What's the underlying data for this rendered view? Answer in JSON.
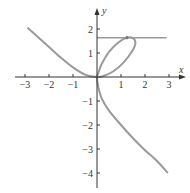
{
  "chart_data": {
    "type": "line",
    "title": "",
    "xlabel": "x",
    "ylabel": "y",
    "xlim": [
      -3.3,
      3.4
    ],
    "ylim": [
      -4.6,
      2.7
    ],
    "xticks": [
      -3,
      -2,
      -1,
      1,
      2,
      3
    ],
    "yticks": [
      2,
      1,
      -1,
      -2,
      -3,
      -4
    ],
    "xtick_labels": [
      "−3",
      "−2",
      "−1",
      "1",
      "2",
      "3"
    ],
    "ytick_labels": [
      "2",
      "1",
      "−1",
      "−2",
      "−3",
      "−4"
    ],
    "grid": false,
    "legend": null,
    "series": [
      {
        "name": "parametric curve",
        "color": "#9a9a9a",
        "points": [
          [
            -2.9,
            2.05
          ],
          [
            -2.5,
            1.7
          ],
          [
            -2.0,
            1.25
          ],
          [
            -1.5,
            0.8
          ],
          [
            -1.0,
            0.4
          ],
          [
            -0.5,
            0.1
          ],
          [
            0.0,
            0.0
          ],
          [
            0.3,
            0.05
          ],
          [
            0.7,
            0.25
          ],
          [
            1.1,
            0.6
          ],
          [
            1.45,
            1.05
          ],
          [
            1.6,
            1.4
          ],
          [
            1.5,
            1.62
          ],
          [
            1.25,
            1.64
          ],
          [
            0.9,
            1.45
          ],
          [
            0.5,
            1.05
          ],
          [
            0.2,
            0.55
          ],
          [
            0.05,
            0.15
          ],
          [
            0.0,
            0.0
          ],
          [
            0.05,
            -0.4
          ],
          [
            0.2,
            -0.9
          ],
          [
            0.5,
            -1.4
          ],
          [
            1.0,
            -2.0
          ],
          [
            1.5,
            -2.55
          ],
          [
            2.0,
            -3.05
          ],
          [
            2.5,
            -3.5
          ],
          [
            2.95,
            -4.0
          ]
        ]
      },
      {
        "name": "horizontal tangent line",
        "color": "#9a9a9a",
        "points": [
          [
            0.0,
            1.64
          ],
          [
            2.9,
            1.64
          ]
        ]
      }
    ],
    "annotations": [
      {
        "type": "point",
        "x": 1.25,
        "y": 1.64,
        "note": "point of horizontal tangency"
      }
    ]
  },
  "axes": {
    "x_label": "x",
    "y_label": "y"
  },
  "colors": {
    "axis": "#333333",
    "curve": "#9a9a9a"
  }
}
